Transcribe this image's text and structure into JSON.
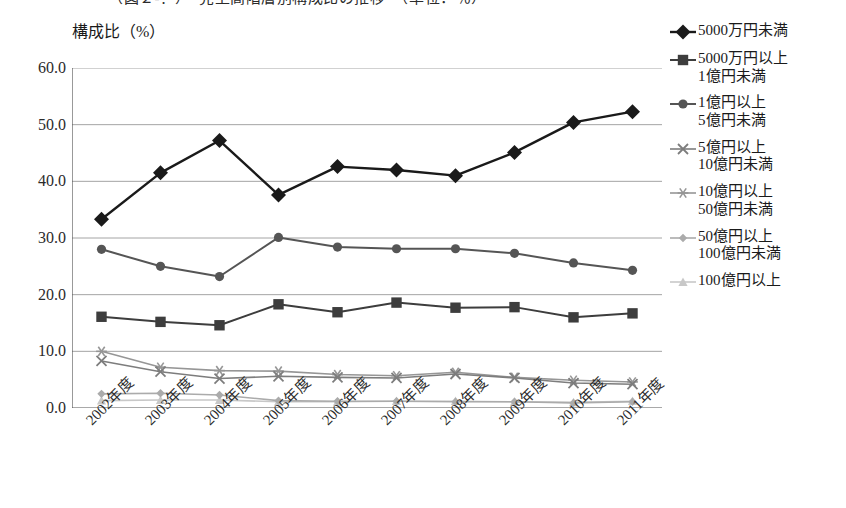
{
  "title_fragment": "（図２-？）　売上高階層別構成比の推移　（単位：％）",
  "axis": {
    "y_unit_label": "構成比（%）",
    "y_ticks": [
      "60.0",
      "50.0",
      "40.0",
      "30.0",
      "20.0",
      "10.0",
      "0.0"
    ]
  },
  "legend": {
    "items": [
      {
        "label": "5000万円未満",
        "marker": "diamond",
        "color": "#1a1a1a"
      },
      {
        "label": "5000万円以上\n1億円未満",
        "marker": "square",
        "color": "#3d3d3d"
      },
      {
        "label": "1億円以上\n5億円未満",
        "marker": "circle",
        "color": "#555555"
      },
      {
        "label": "5億円以上\n10億円未満",
        "marker": "x-cross",
        "color": "#7d7d7d"
      },
      {
        "label": "10億円以上\n50億円未満",
        "marker": "asterisk",
        "color": "#969696"
      },
      {
        "label": "50億円以上\n100億円未満",
        "marker": "small-diamond",
        "color": "#ababab"
      },
      {
        "label": "100億円以上",
        "marker": "triangle",
        "color": "#c8c8c8"
      }
    ]
  },
  "chart_data": {
    "type": "line",
    "title": "",
    "xlabel": "",
    "ylabel": "構成比（%）",
    "ylim": [
      0,
      60
    ],
    "ytick_step": 10,
    "grid": true,
    "legend_position": "right",
    "categories": [
      "2002年度",
      "2003年度",
      "2004年度",
      "2005年度",
      "2006年度",
      "2007年度",
      "2008年度",
      "2009年度",
      "2010年度",
      "2011年度"
    ],
    "series": [
      {
        "name": "5000万円未満",
        "marker": "diamond",
        "color": "#1a1a1a",
        "values": [
          33.3,
          41.5,
          47.2,
          37.6,
          42.6,
          42.0,
          41.0,
          45.1,
          50.4,
          52.3
        ]
      },
      {
        "name": "5000万円以上1億円未満",
        "marker": "square",
        "color": "#3d3d3d",
        "values": [
          16.1,
          15.2,
          14.6,
          18.3,
          16.9,
          18.6,
          17.7,
          17.8,
          16.0,
          16.7
        ]
      },
      {
        "name": "1億円以上5億円未満",
        "marker": "circle",
        "color": "#555555",
        "values": [
          28.0,
          25.0,
          23.2,
          30.1,
          28.4,
          28.1,
          28.1,
          27.3,
          25.6,
          24.3
        ]
      },
      {
        "name": "5億円以上10億円未満",
        "marker": "x-cross",
        "color": "#7d7d7d",
        "values": [
          8.3,
          6.4,
          5.2,
          5.6,
          5.4,
          5.3,
          6.0,
          5.3,
          4.4,
          4.2
        ]
      },
      {
        "name": "10億円以上50億円未満",
        "marker": "asterisk",
        "color": "#969696",
        "values": [
          10.0,
          7.2,
          6.6,
          6.5,
          5.9,
          5.7,
          6.3,
          5.4,
          4.9,
          4.6
        ]
      },
      {
        "name": "50億円以上100億円未満",
        "marker": "small-diamond",
        "color": "#ababab",
        "values": [
          2.5,
          2.6,
          2.3,
          1.3,
          1.2,
          1.2,
          1.1,
          1.1,
          0.9,
          1.1
        ]
      },
      {
        "name": "100億円以上",
        "marker": "triangle",
        "color": "#c8c8c8",
        "values": [
          1.3,
          1.4,
          1.4,
          1.1,
          1.1,
          1.2,
          1.2,
          1.1,
          1.0,
          1.2
        ]
      }
    ]
  }
}
